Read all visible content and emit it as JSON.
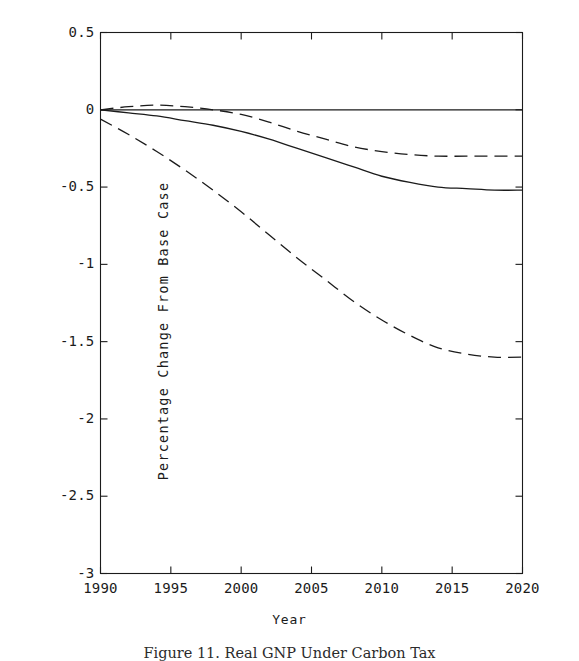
{
  "figure": {
    "caption": "Figure 11.  Real GNP Under Carbon Tax"
  },
  "chart_data": {
    "type": "line",
    "title": "",
    "xlabel": "Year",
    "ylabel": "Percentage Change From Base Case",
    "xlim": [
      1990,
      2020
    ],
    "ylim": [
      -3,
      0.5
    ],
    "grid": false,
    "legend": "none",
    "xticks": [
      "1990",
      "1995",
      "2000",
      "2005",
      "2010",
      "2015",
      "2020"
    ],
    "xtick_values": [
      1990,
      1995,
      2000,
      2005,
      2010,
      2015,
      2020
    ],
    "yticks": [
      "0.5",
      "0",
      "-0.5",
      "-1",
      "-1.5",
      "-2",
      "-2.5",
      "-3"
    ],
    "ytick_values": [
      0.5,
      0,
      -0.5,
      -1,
      -1.5,
      -2,
      -2.5,
      -3
    ],
    "x": [
      1990,
      1992,
      1994,
      1996,
      1998,
      2000,
      2002,
      2004,
      2006,
      2008,
      2010,
      2012,
      2014,
      2016,
      2018,
      2020
    ],
    "series": [
      {
        "name": "baseline-zero-line",
        "style": "solid",
        "color": "#1b1b1b",
        "values": [
          0.0,
          0.0,
          0.0,
          0.0,
          0.0,
          0.0,
          0.0,
          0.0,
          0.0,
          0.0,
          0.0,
          0.0,
          0.0,
          0.0,
          0.0,
          0.0
        ]
      },
      {
        "name": "upper-dashed",
        "style": "dashed",
        "color": "#1b1b1b",
        "values": [
          0.0,
          0.02,
          0.03,
          0.02,
          0.0,
          -0.03,
          -0.08,
          -0.14,
          -0.19,
          -0.24,
          -0.27,
          -0.29,
          -0.3,
          -0.3,
          -0.3,
          -0.3
        ]
      },
      {
        "name": "middle-solid",
        "style": "solid",
        "color": "#1b1b1b",
        "values": [
          0.0,
          -0.02,
          -0.04,
          -0.07,
          -0.1,
          -0.14,
          -0.19,
          -0.25,
          -0.31,
          -0.37,
          -0.43,
          -0.47,
          -0.5,
          -0.51,
          -0.52,
          -0.52
        ]
      },
      {
        "name": "lower-dashed",
        "style": "dashed",
        "color": "#1b1b1b",
        "values": [
          -0.06,
          -0.16,
          -0.27,
          -0.39,
          -0.52,
          -0.66,
          -0.81,
          -0.96,
          -1.1,
          -1.24,
          -1.36,
          -1.46,
          -1.54,
          -1.58,
          -1.6,
          -1.6
        ]
      }
    ]
  },
  "colors": {
    "ink": "#1b1b1b",
    "background": "#ffffff"
  }
}
